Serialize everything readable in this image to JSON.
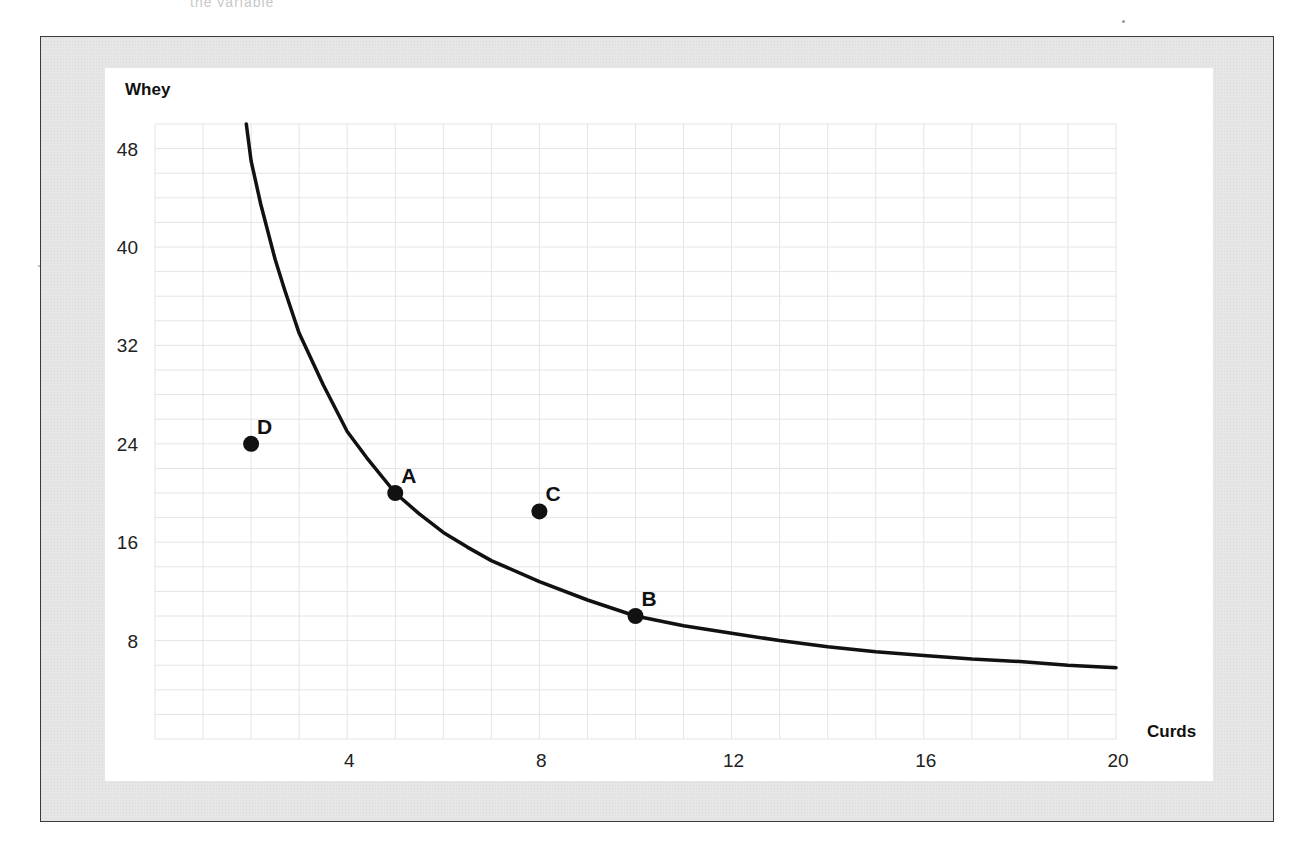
{
  "page": {
    "cutoff_header_text": "the variable"
  },
  "chart_data": {
    "type": "line",
    "title": "",
    "xlabel": "Curds",
    "ylabel": "Whey",
    "xlim": [
      0,
      20
    ],
    "ylim": [
      0,
      50
    ],
    "grid": true,
    "grid_x_step": 1,
    "grid_y_step": 2,
    "x_ticks": [
      4,
      8,
      12,
      16,
      20
    ],
    "y_ticks": [
      8,
      16,
      24,
      32,
      40,
      48
    ],
    "series": [
      {
        "name": "curve",
        "type": "line",
        "color": "#111111",
        "x": [
          1.9,
          2.0,
          2.2,
          2.5,
          2.7,
          3.0,
          3.5,
          4.0,
          4.4,
          5.0,
          5.5,
          6.0,
          6.5,
          7.0,
          8.0,
          9.0,
          10.0,
          11.0,
          12.0,
          13.0,
          14.0,
          15.0,
          16.0,
          17.0,
          18.0,
          19.0,
          20.0
        ],
        "y": [
          50.0,
          47.0,
          43.5,
          39.0,
          36.5,
          33.0,
          28.8,
          25.0,
          22.9,
          20.0,
          18.3,
          16.8,
          15.6,
          14.5,
          12.8,
          11.3,
          10.0,
          9.2,
          8.6,
          8.0,
          7.5,
          7.1,
          6.8,
          6.5,
          6.3,
          6.0,
          5.8
        ]
      }
    ],
    "points": [
      {
        "label": "D",
        "x": 2,
        "y": 24
      },
      {
        "label": "A",
        "x": 5,
        "y": 20
      },
      {
        "label": "C",
        "x": 8,
        "y": 18.5
      },
      {
        "label": "B",
        "x": 10,
        "y": 10
      }
    ]
  }
}
